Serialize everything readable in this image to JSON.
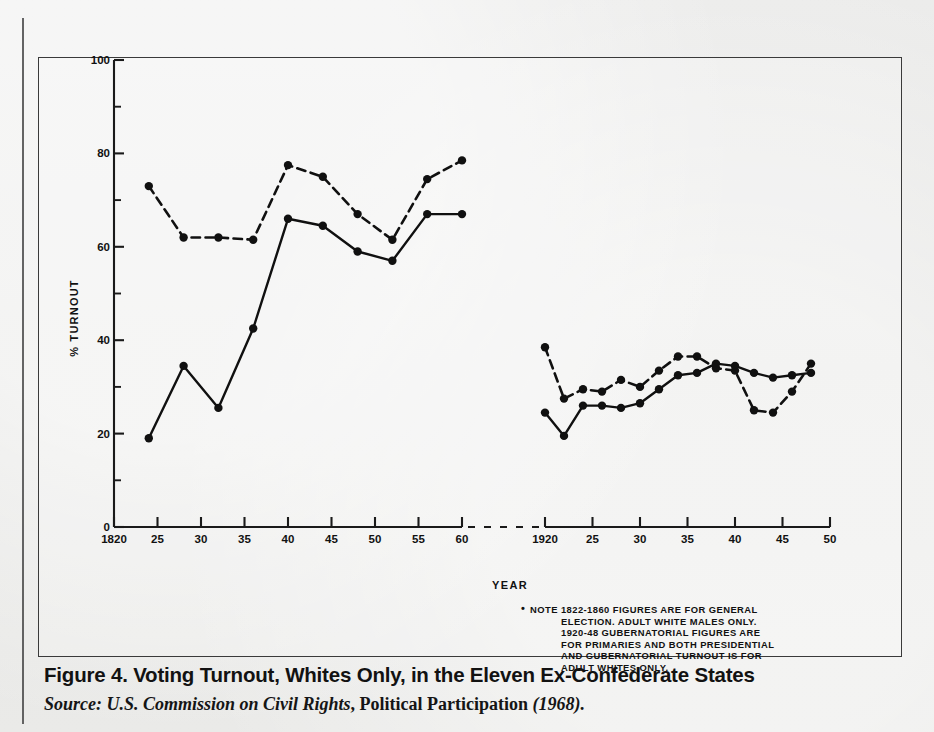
{
  "figure": {
    "caption": "Figure 4. Voting Turnout, Whites Only, in the Eleven Ex-Confederate States",
    "source_prefix": "Source:",
    "source_agency": "U.S. Commission on Civil Rights",
    "source_comma": ",",
    "source_title": "Political Participation",
    "source_year": "(1968)."
  },
  "note": {
    "marker": "•",
    "lines": [
      "NOTE  1822-1860  FIGURES  ARE  FOR  GENERAL",
      "ELECTION.  ADULT  WHITE  MALES  ONLY.",
      "1920-48  GUBERNATORIAL  FIGURES  ARE",
      "FOR PRIMARIES AND BOTH PRESIDENTIAL",
      "AND  GUBERNATORIAL  TURNOUT  IS  FOR",
      "ADULT WHITES ONLY."
    ]
  },
  "chart_data": {
    "type": "line",
    "title": "Voting Turnout, Whites Only, in the Eleven Ex-Confederate States",
    "xlabel": "YEAR",
    "ylabel": "% TURNOUT",
    "ylim": [
      0,
      100
    ],
    "yticks": [
      0,
      20,
      40,
      60,
      80,
      100
    ],
    "ytick_labels": [
      "0",
      "20",
      "40",
      "60",
      "80",
      "100"
    ],
    "yminor_ticks": [
      10,
      30,
      50,
      70,
      90
    ],
    "grid": false,
    "legend_position": "none",
    "axis_break": true,
    "panels": [
      {
        "name": "panel-1822-1860",
        "xlim": [
          1820,
          1861
        ],
        "xticks": [
          1820,
          1825,
          1830,
          1835,
          1840,
          1845,
          1850,
          1855,
          1860
        ],
        "xtick_labels": [
          "1820",
          "25",
          "30",
          "35",
          "40",
          "45",
          "50",
          "55",
          "60"
        ],
        "series": [
          {
            "name": "presidential-turnout-dashed",
            "style": "dashed",
            "marker": "filled-circle",
            "x": [
              1824,
              1828,
              1832,
              1836,
              1840,
              1844,
              1848,
              1852,
              1856,
              1860
            ],
            "y": [
              73,
              62,
              62,
              61.5,
              77.5,
              75,
              67,
              61.5,
              74.5,
              78.5
            ]
          },
          {
            "name": "gubernatorial-turnout-solid",
            "style": "solid",
            "marker": "filled-circle",
            "x": [
              1824,
              1828,
              1832,
              1836,
              1840,
              1844,
              1848,
              1852,
              1856,
              1860
            ],
            "y": [
              19,
              34.5,
              25.5,
              42.5,
              66,
              64.5,
              59,
              57,
              67,
              67
            ]
          }
        ],
        "dashed_extra_x": [
          1838,
          1842,
          1846,
          1854,
          1858
        ],
        "dashed_extra_y": [
          70,
          72.5,
          66.5,
          67,
          66.5
        ]
      },
      {
        "name": "panel-1920-1948",
        "xlim": [
          1920,
          1950
        ],
        "xticks": [
          1920,
          1925,
          1930,
          1935,
          1940,
          1945,
          1950
        ],
        "xtick_labels": [
          "1920",
          "25",
          "30",
          "35",
          "40",
          "45",
          "50"
        ],
        "series": [
          {
            "name": "presidential-turnout-dashed",
            "style": "dashed",
            "marker": "filled-circle",
            "x": [
              1920,
              1922,
              1924,
              1926,
              1928,
              1930,
              1932,
              1934,
              1936,
              1938,
              1940,
              1942,
              1944,
              1946,
              1948
            ],
            "y": [
              38.5,
              27.5,
              29.5,
              29,
              31.5,
              30,
              33.5,
              36.5,
              36.5,
              34,
              33.5,
              25,
              24.5,
              29,
              35
            ]
          },
          {
            "name": "gubernatorial-turnout-solid",
            "style": "solid",
            "marker": "filled-circle",
            "x": [
              1920,
              1922,
              1924,
              1926,
              1928,
              1930,
              1932,
              1934,
              1936,
              1938,
              1940,
              1942,
              1944,
              1946,
              1948
            ],
            "y": [
              24.5,
              19.5,
              26,
              26,
              25.5,
              26.5,
              29.5,
              32.5,
              33,
              35,
              34.5,
              33,
              32,
              32.5,
              33
            ]
          }
        ]
      }
    ]
  }
}
